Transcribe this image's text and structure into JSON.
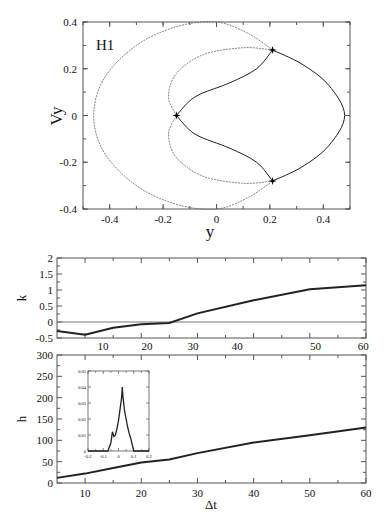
{
  "chart_data": [
    {
      "id": "phase",
      "type": "scatter",
      "title": "",
      "annotation": "H1",
      "xlabel": "y",
      "ylabel": "Vy",
      "xlim": [
        -0.5,
        0.5
      ],
      "ylim": [
        -0.4,
        0.4
      ],
      "xticks": [
        -0.4,
        -0.2,
        0,
        0.2,
        0.4
      ],
      "xtick_labels": [
        "-0.4",
        "-0.2",
        "0",
        "0.2",
        "0.4"
      ],
      "yticks": [
        -0.4,
        -0.2,
        0,
        0.2,
        0.4
      ],
      "ytick_labels": [
        "-0.4",
        "-0.2",
        "0",
        "0.2",
        "0.4"
      ],
      "grid": false,
      "fixed_points": [
        {
          "y": -0.15,
          "vy": 0.0
        },
        {
          "y": 0.21,
          "vy": 0.28
        },
        {
          "y": 0.21,
          "vy": -0.28
        }
      ],
      "series": [
        {
          "name": "outer-left-arc",
          "points": [
            [
              0.21,
              0.28
            ],
            [
              0.12,
              0.35
            ],
            [
              0.0,
              0.4
            ],
            [
              -0.15,
              0.38
            ],
            [
              -0.3,
              0.3
            ],
            [
              -0.42,
              0.16
            ],
            [
              -0.46,
              0.0
            ],
            [
              -0.42,
              -0.16
            ],
            [
              -0.3,
              -0.3
            ],
            [
              -0.15,
              -0.38
            ],
            [
              0.0,
              -0.4
            ],
            [
              0.12,
              -0.35
            ],
            [
              0.21,
              -0.28
            ]
          ]
        },
        {
          "name": "outer-right-arc",
          "points": [
            [
              0.21,
              0.28
            ],
            [
              0.32,
              0.22
            ],
            [
              0.42,
              0.13
            ],
            [
              0.48,
              0.0
            ],
            [
              0.42,
              -0.13
            ],
            [
              0.32,
              -0.22
            ],
            [
              0.21,
              -0.28
            ]
          ]
        },
        {
          "name": "inner-upper-left",
          "points": [
            [
              0.21,
              0.28
            ],
            [
              0.1,
              0.29
            ],
            [
              -0.05,
              0.26
            ],
            [
              -0.15,
              0.18
            ],
            [
              -0.18,
              0.08
            ],
            [
              -0.15,
              0.0
            ]
          ]
        },
        {
          "name": "inner-upper-right",
          "points": [
            [
              -0.15,
              0.0
            ],
            [
              -0.08,
              0.08
            ],
            [
              0.05,
              0.14
            ],
            [
              0.15,
              0.2
            ],
            [
              0.21,
              0.28
            ]
          ]
        },
        {
          "name": "inner-lower-left",
          "points": [
            [
              0.21,
              -0.28
            ],
            [
              0.1,
              -0.29
            ],
            [
              -0.05,
              -0.26
            ],
            [
              -0.15,
              -0.18
            ],
            [
              -0.18,
              -0.08
            ],
            [
              -0.15,
              0.0
            ]
          ]
        },
        {
          "name": "inner-lower-right",
          "points": [
            [
              -0.15,
              0.0
            ],
            [
              -0.08,
              -0.08
            ],
            [
              0.05,
              -0.14
            ],
            [
              0.15,
              -0.2
            ],
            [
              0.21,
              -0.28
            ]
          ]
        }
      ]
    },
    {
      "id": "k-panel",
      "type": "line",
      "xlabel": "",
      "ylabel": "k",
      "xlim": [
        5,
        60
      ],
      "ylim": [
        -0.5,
        2
      ],
      "yticks": [
        -0.5,
        0,
        0.5,
        1,
        1.5,
        2
      ],
      "ytick_labels": [
        "-0.5",
        "0",
        "0.5",
        "1",
        "1.5",
        "2"
      ],
      "xtick_labels": [
        "10",
        "20",
        "30",
        "40",
        "50",
        "60"
      ],
      "xtick_label_positions": [
        13.2,
        21.0,
        29.2,
        37.1,
        51.0,
        59.5
      ],
      "reference_line_y": 0,
      "x": [
        5,
        10,
        15,
        20,
        25,
        30,
        40,
        50,
        60
      ],
      "series": [
        {
          "name": "k",
          "values": [
            -0.28,
            -0.4,
            -0.18,
            -0.07,
            -0.03,
            0.27,
            0.68,
            1.02,
            1.15
          ]
        }
      ]
    },
    {
      "id": "h-panel",
      "type": "line",
      "xlabel": "Δt",
      "ylabel": "h",
      "xlim": [
        5,
        60
      ],
      "ylim": [
        0,
        300
      ],
      "xticks": [
        10,
        20,
        30,
        40,
        50,
        60
      ],
      "xtick_labels": [
        "10",
        "20",
        "30",
        "40",
        "50",
        "60"
      ],
      "yticks": [
        0,
        50,
        100,
        150,
        200,
        250,
        300
      ],
      "ytick_labels": [
        "0",
        "50",
        "100",
        "150",
        "200",
        "250",
        "300"
      ],
      "x": [
        5,
        10,
        15,
        20,
        25,
        30,
        40,
        50,
        60
      ],
      "series": [
        {
          "name": "h",
          "values": [
            12,
            22,
            35,
            48,
            55,
            70,
            95,
            112,
            130
          ]
        }
      ],
      "inset": {
        "type": "line",
        "xlim": [
          -0.2,
          0.2
        ],
        "ylim": [
          0,
          0.05
        ],
        "xticks": [
          -0.2,
          -0.1,
          0,
          0.1,
          0.2
        ],
        "xtick_labels": [
          "-0.2",
          "-0.1",
          "0",
          "0.1",
          "0.2"
        ],
        "yticks": [
          0,
          0.01,
          0.02,
          0.03,
          0.04,
          0.05
        ],
        "ytick_labels": [
          "0",
          "0.01",
          "0.02",
          "0.03",
          "0.04",
          "0.05"
        ],
        "x": [
          -0.2,
          -0.07,
          -0.05,
          -0.04,
          -0.03,
          -0.02,
          -0.01,
          0.0,
          0.01,
          0.02,
          0.025,
          0.03,
          0.04,
          0.05,
          0.06,
          0.07,
          0.08,
          0.09,
          0.1,
          0.2
        ],
        "values": [
          0,
          0,
          0.005,
          0.012,
          0.009,
          0.01,
          0.014,
          0.019,
          0.026,
          0.033,
          0.04,
          0.033,
          0.025,
          0.02,
          0.015,
          0.011,
          0.008,
          0.004,
          0,
          0
        ]
      }
    }
  ]
}
